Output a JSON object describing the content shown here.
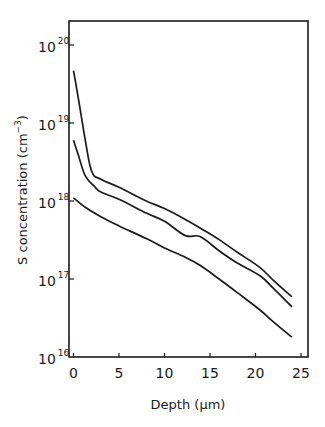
{
  "chart_data": {
    "type": "line",
    "title": "",
    "xlabel": "Depth (µm)",
    "ylabel": "S concentration (cm⁻³)",
    "y_scale": "log",
    "xlim": [
      0,
      26
    ],
    "ylim": [
      1e+16,
      1e+20
    ],
    "grid": false,
    "legend": null,
    "x_ticks": [
      "0",
      "5",
      "10",
      "15",
      "20",
      "25"
    ],
    "y_ticks": [
      {
        "base": "10",
        "exp": "20"
      },
      {
        "base": "10",
        "exp": "19"
      },
      {
        "base": "10",
        "exp": "18"
      },
      {
        "base": "10",
        "exp": "17"
      },
      {
        "base": "10",
        "exp": "16"
      }
    ],
    "series": [
      {
        "name": "curve-top",
        "x": [
          0,
          0.5,
          1.3,
          2.0,
          3.0,
          5,
          8,
          10,
          12.3,
          13.9,
          16,
          18,
          20.5,
          22,
          24
        ],
        "y": [
          4.7e+19,
          2.2e+19,
          6e+18,
          2.4e+18,
          1.9e+18,
          1.5e+18,
          1e+18,
          8e+17,
          5.8e+17,
          4.5e+17,
          3.2e+17,
          2.2e+17,
          1.4e+17,
          9.5e+16,
          5.9e+16
        ]
      },
      {
        "name": "curve-middle",
        "x": [
          0,
          0.5,
          1.3,
          2.4,
          3.0,
          5,
          8,
          10,
          12.3,
          13.9,
          16,
          18,
          20.5,
          22,
          24
        ],
        "y": [
          6e+18,
          4e+18,
          2.1e+18,
          1.5e+18,
          1.3e+18,
          1.05e+18,
          7e+17,
          5.5e+17,
          3.6e+17,
          3.5e+17,
          2.3e+17,
          1.6e+17,
          1.1e+17,
          7.5e+16,
          4.4e+16
        ]
      },
      {
        "name": "curve-bottom",
        "x": [
          0,
          1.3,
          3,
          5,
          8,
          10,
          12.3,
          13.9,
          16,
          18,
          20.5,
          22,
          24
        ],
        "y": [
          1.1e+18,
          8.3e+17,
          6.3e+17,
          4.8e+17,
          3.3e+17,
          2.5e+17,
          1.9e+17,
          1.5e+17,
          1e+17,
          6.7e+16,
          4e+16,
          2.8e+16,
          1.8e+16
        ]
      }
    ]
  },
  "axes": {
    "x_title": "Depth (µm)",
    "y_title": "S concentration (cm⁻³)",
    "y_title_main": "S concentration (cm",
    "y_title_exp": "−3",
    "y_title_close": ")"
  },
  "style": {
    "line_color": "#1a1a1a",
    "background": "#ffffff"
  }
}
